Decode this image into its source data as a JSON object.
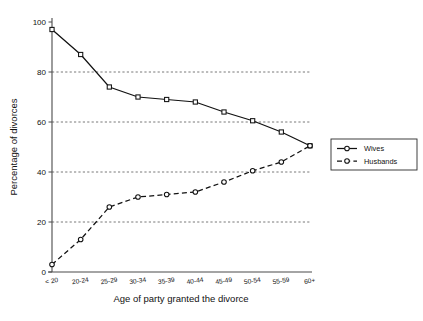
{
  "chart_data": {
    "type": "line",
    "title": "",
    "xlabel": "Age of party granted the divorce",
    "ylabel": "Percentage of divorces",
    "categories": [
      "< 20",
      "20-24",
      "25-29",
      "30-34",
      "35-39",
      "40-44",
      "45-49",
      "50-54",
      "55-59",
      "60+"
    ],
    "series": [
      {
        "name": "Wives",
        "values": [
          97,
          87,
          74,
          70,
          69,
          68,
          64,
          60.5,
          56,
          50.5
        ],
        "line_style": "solid",
        "marker": "square"
      },
      {
        "name": "Husbands",
        "values": [
          3,
          13,
          26,
          30,
          31,
          32,
          36,
          40.5,
          44,
          50.5
        ],
        "line_style": "dashed",
        "marker": "circle"
      }
    ],
    "ylim": [
      0,
      100
    ],
    "yticks": [
      0,
      20,
      40,
      60,
      80,
      100
    ],
    "ytick_labels": [
      "0",
      "20",
      "40",
      "60",
      "80",
      "100"
    ],
    "gridlines_at": [
      20,
      40,
      60,
      80
    ],
    "grid": true,
    "legend_position": "right"
  },
  "legend": {
    "entries": [
      {
        "label": "Wives"
      },
      {
        "label": "Husbands"
      }
    ]
  },
  "colors": {
    "ink": "#111111",
    "axis": "#4a4a4a",
    "grid": "#555555",
    "background": "#ffffff"
  }
}
